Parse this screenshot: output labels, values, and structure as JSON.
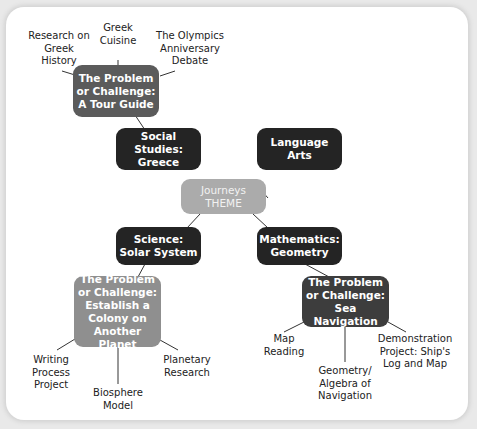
{
  "diagram": {
    "theme": {
      "line1": "Journeys",
      "line2": "THEME"
    },
    "subjects": {
      "social_studies": "Social Studies: Greece",
      "language_arts": "Language Arts",
      "science": "Science: Solar System",
      "mathematics": "Mathematics: Geometry"
    },
    "challenges": {
      "tour_guide": "The Problem or Challenge: A Tour Guide",
      "colony": "The Problem or Challenge: Establish a Colony on Another Planet",
      "sea_navigation": "The Problem or Challenge: Sea Navigation"
    },
    "activities": {
      "tour_guide": [
        "Research on Greek History",
        "Greek Cuisine",
        "The Olympics Anniversary Debate"
      ],
      "colony": [
        "Writing Process Project",
        "Biosphere Model",
        "Planetary Research"
      ],
      "sea_navigation": [
        "Map Reading",
        "Geometry/ Algebra of Navigation",
        "Demonstration Project: Ship's Log and Map"
      ]
    },
    "colors": {
      "subject_box": "#242424",
      "theme_box": "#ababab",
      "tour_guide_box": "#5b5b5b",
      "colony_box": "#8f8f8f",
      "sea_navigation_box": "#3d3d3d",
      "connector": "#333333"
    }
  }
}
